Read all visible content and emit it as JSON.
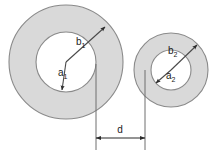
{
  "figure": {
    "type": "geometry-diagram",
    "background_color": "#ffffff",
    "ring_fill_color": "#d9d9d9",
    "ring_stroke_color": "#8a8a8a",
    "hole_fill_color": "#ffffff",
    "arrow_color": "#4a4a4a",
    "dimension_color": "#2b2b2b"
  },
  "shapes": {
    "left_annulus": {
      "name": "left-annulus",
      "center_x": 66,
      "center_y": 62,
      "outer_radius": 57,
      "inner_radius": 30,
      "inner_radius_label": "a",
      "inner_radius_subscript": "1",
      "outer_radius_label": "b",
      "outer_radius_subscript": "1"
    },
    "right_annulus": {
      "name": "right-annulus",
      "center_x": 171,
      "center_y": 70,
      "outer_radius": 37,
      "inner_radius": 20,
      "inner_radius_label": "a",
      "inner_radius_subscript": "2",
      "outer_radius_label": "b",
      "outer_radius_subscript": "2"
    }
  },
  "dimension": {
    "name": "separation-distance",
    "label": "d",
    "y": 138,
    "x_start": 96,
    "x_end": 145,
    "ext_line_left_top": 70,
    "ext_line_right_top": 70,
    "ext_line_bottom": 150
  },
  "labels": {
    "a1": {
      "text": "a",
      "sub": "1",
      "x": 58,
      "y": 76
    },
    "b1": {
      "text": "b",
      "sub": "1",
      "x": 76,
      "y": 45
    },
    "a2": {
      "text": "a",
      "sub": "2",
      "x": 166,
      "y": 79
    },
    "b2": {
      "text": "b",
      "sub": "2",
      "x": 168,
      "y": 54
    },
    "d": {
      "text": "d",
      "x": 120,
      "y": 133
    }
  }
}
